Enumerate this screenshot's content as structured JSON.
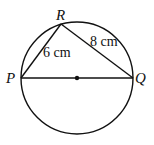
{
  "diagram": {
    "points": {
      "P": "P",
      "Q": "Q",
      "R": "R"
    },
    "lengths": {
      "PR": "6 cm",
      "RQ": "8 cm"
    }
  }
}
